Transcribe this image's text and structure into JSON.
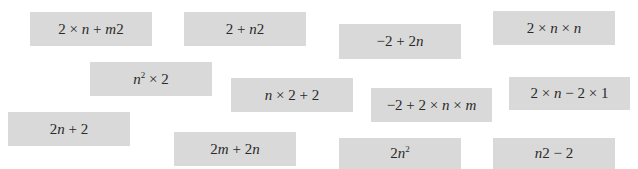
{
  "colors": {
    "background": "#ffffff",
    "card": "#d9d9d9",
    "text": "#2a2a2a"
  },
  "cards": [
    {
      "id": "c1",
      "expression": "2 × n + m2",
      "x": 30,
      "y": 12,
      "w": 122,
      "h": 34
    },
    {
      "id": "c2",
      "expression": "2 + n2",
      "x": 184,
      "y": 12,
      "w": 122,
      "h": 34
    },
    {
      "id": "c3",
      "expression": "−2 + 2n",
      "x": 339,
      "y": 24,
      "w": 122,
      "h": 35
    },
    {
      "id": "c4",
      "expression": "2 × n × n",
      "x": 493,
      "y": 11,
      "w": 122,
      "h": 34
    },
    {
      "id": "c5",
      "expression": "n² × 2",
      "x": 90,
      "y": 62,
      "w": 122,
      "h": 34
    },
    {
      "id": "c6",
      "expression": "n × 2 + 2",
      "x": 231,
      "y": 78,
      "w": 122,
      "h": 34
    },
    {
      "id": "c7",
      "expression": "−2 + 2 × n × m",
      "x": 371,
      "y": 88,
      "w": 121,
      "h": 34
    },
    {
      "id": "c8",
      "expression": "2 × n − 2 × 1",
      "x": 509,
      "y": 77,
      "w": 121,
      "h": 33
    },
    {
      "id": "c9",
      "expression": "2n + 2",
      "x": 8,
      "y": 112,
      "w": 122,
      "h": 34
    },
    {
      "id": "c10",
      "expression": "2m + 2n",
      "x": 174,
      "y": 132,
      "w": 122,
      "h": 34
    },
    {
      "id": "c11",
      "expression": "2n²",
      "x": 339,
      "y": 138,
      "w": 122,
      "h": 31
    },
    {
      "id": "c12",
      "expression": "n2 − 2",
      "x": 493,
      "y": 138,
      "w": 122,
      "h": 31
    }
  ]
}
